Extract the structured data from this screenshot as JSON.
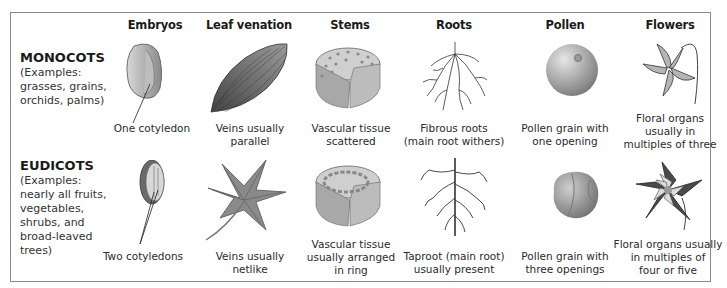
{
  "figure": {
    "columns": [
      "Embryos",
      "Leaf venation",
      "Stems",
      "Roots",
      "Pollen",
      "Flowers"
    ],
    "groups": [
      {
        "name": "MONOCOTS",
        "examples": [
          "(Examples:",
          "grasses, grains,",
          "orchids, palms)"
        ],
        "cells": [
          {
            "illustration": "single-cotyledon-seed",
            "caption": [
              "One cotyledon"
            ]
          },
          {
            "illustration": "parallel-veined-leaf",
            "caption": [
              "Veins usually",
              "parallel"
            ]
          },
          {
            "illustration": "stem-section-scattered-bundles",
            "caption": [
              "Vascular tissue",
              "scattered"
            ]
          },
          {
            "illustration": "fibrous-roots",
            "caption": [
              "Fibrous roots",
              "(main root withers)"
            ]
          },
          {
            "illustration": "pollen-one-opening",
            "caption": [
              "Pollen grain with",
              "one opening"
            ]
          },
          {
            "illustration": "three-part-flower",
            "caption": [
              "Floral organs",
              "usually in",
              "multiples of three"
            ]
          }
        ]
      },
      {
        "name": "EUDICOTS",
        "examples": [
          "(Examples:",
          "nearly all fruits,",
          "vegetables,",
          "shrubs, and",
          "broad-leaved",
          "trees)"
        ],
        "cells": [
          {
            "illustration": "two-cotyledon-seed",
            "caption": [
              "Two cotyledons"
            ]
          },
          {
            "illustration": "net-veined-leaf",
            "caption": [
              "Veins usually",
              "netlike"
            ]
          },
          {
            "illustration": "stem-section-ring-bundles",
            "caption": [
              "Vascular tissue",
              "usually arranged",
              "in ring"
            ]
          },
          {
            "illustration": "taproot",
            "caption": [
              "Taproot (main root)",
              "usually present"
            ]
          },
          {
            "illustration": "pollen-three-openings",
            "caption": [
              "Pollen grain with",
              "three openings"
            ]
          },
          {
            "illustration": "five-part-flower",
            "caption": [
              "Floral organs usually",
              "in multiples of",
              "four or five"
            ]
          }
        ]
      }
    ]
  }
}
